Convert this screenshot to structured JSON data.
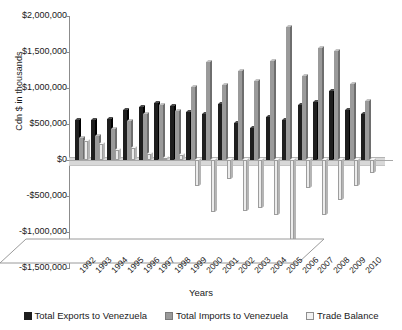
{
  "chart_data": {
    "type": "bar",
    "title": "",
    "xlabel": "Years",
    "ylabel": "Cdn $ in thousands",
    "ylim": [
      -1500000,
      2000000
    ],
    "ytick_values": [
      2000000,
      1500000,
      1000000,
      500000,
      0,
      -500000,
      -1000000,
      -1500000
    ],
    "ytick_labels": [
      "$2,000,000",
      "$1,500,000",
      "$1,000,000",
      "$500,000",
      "$0",
      "-$500,000",
      "-$1,000,000",
      "-$1,500,000"
    ],
    "grid": false,
    "legend_position": "bottom",
    "three_d": true,
    "categories": [
      "1992",
      "1993",
      "1994",
      "1995",
      "1996",
      "1997",
      "1998",
      "1999",
      "2000",
      "2001",
      "2002",
      "2003",
      "2004",
      "2005",
      "2006",
      "2007",
      "2008",
      "2009",
      "2010"
    ],
    "series": [
      {
        "name": "Total Exports to Venezuela",
        "color": "#1e1e1e",
        "values": [
          560000,
          555000,
          565000,
          700000,
          730000,
          790000,
          745000,
          660000,
          640000,
          780000,
          520000,
          440000,
          600000,
          560000,
          770000,
          800000,
          960000,
          700000,
          640000
        ]
      },
      {
        "name": "Total Imports to Venezuela",
        "color": "#9a9a9a",
        "values": [
          300000,
          330000,
          430000,
          540000,
          640000,
          760000,
          680000,
          1020000,
          1360000,
          1040000,
          1230000,
          1100000,
          1370000,
          1850000,
          1160000,
          1560000,
          1520000,
          1060000,
          820000
        ]
      },
      {
        "name": "Trade Balance",
        "color": "#ececec",
        "values": [
          260000,
          225000,
          135000,
          160000,
          90000,
          30000,
          65000,
          -360000,
          -720000,
          -260000,
          -710000,
          -660000,
          -770000,
          -1290000,
          -390000,
          -760000,
          -560000,
          -360000,
          -180000
        ]
      }
    ]
  },
  "legend": {
    "items": [
      {
        "label": "Total Exports to Venezuela",
        "swatch": "exports-swatch"
      },
      {
        "label": "Total Imports to Venezuela",
        "swatch": "imports-swatch"
      },
      {
        "label": "Trade Balance",
        "swatch": "balance-swatch"
      }
    ]
  }
}
